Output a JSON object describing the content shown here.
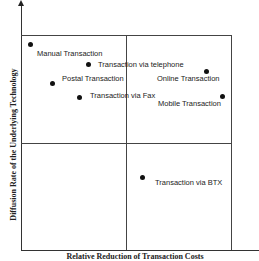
{
  "chart_data": {
    "type": "scatter",
    "title": "",
    "xlabel": "Relative Reduction of Transaction Costs",
    "ylabel": "Diffusion Rate of the Underlying Technology",
    "grid": "2x2 quadrant matrix",
    "axis_ranges": {
      "x": [
        0,
        1
      ],
      "y": [
        0,
        1
      ]
    },
    "points": [
      {
        "label": "Manual Transaction",
        "x": 0.04,
        "y": 0.96,
        "px": 30,
        "py": 44,
        "lx": 37,
        "ly": 50
      },
      {
        "label": "Transaction via telephone",
        "x": 0.32,
        "y": 0.87,
        "px": 88,
        "py": 64,
        "lx": 98,
        "ly": 61
      },
      {
        "label": "Postal Transaction",
        "x": 0.15,
        "y": 0.78,
        "px": 52,
        "py": 83,
        "lx": 62,
        "ly": 75
      },
      {
        "label": "Transaction via Fax",
        "x": 0.28,
        "y": 0.71,
        "px": 79,
        "py": 97,
        "lx": 90,
        "ly": 92
      },
      {
        "label": "Online Transaction",
        "x": 0.88,
        "y": 0.84,
        "px": 206,
        "py": 71,
        "lx": 157,
        "ly": 75
      },
      {
        "label": "Mobile Transaction",
        "x": 0.95,
        "y": 0.72,
        "px": 222,
        "py": 96,
        "lx": 158,
        "ly": 100
      },
      {
        "label": "Transaction via BTX",
        "x": 0.57,
        "y": 0.34,
        "px": 142,
        "py": 177,
        "lx": 155,
        "ly": 179
      }
    ]
  }
}
